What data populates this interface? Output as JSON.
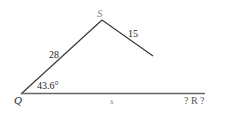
{
  "diagram": {
    "type": "triangle-ambiguous-case",
    "vertices": {
      "S": {
        "label": "S",
        "color": "#8a8a8a"
      },
      "Q": {
        "label": "Q",
        "color": "#222222"
      },
      "R": {
        "label": "? R ?",
        "color": "#555555"
      }
    },
    "sides": {
      "QS": {
        "label": "28"
      },
      "SR": {
        "label": "15"
      },
      "QR": {
        "label": "s",
        "color": "#8a8a8a"
      }
    },
    "angle_Q": {
      "label": "43.6°"
    },
    "colors": {
      "line": "#333333",
      "base_line": "#666666"
    }
  }
}
